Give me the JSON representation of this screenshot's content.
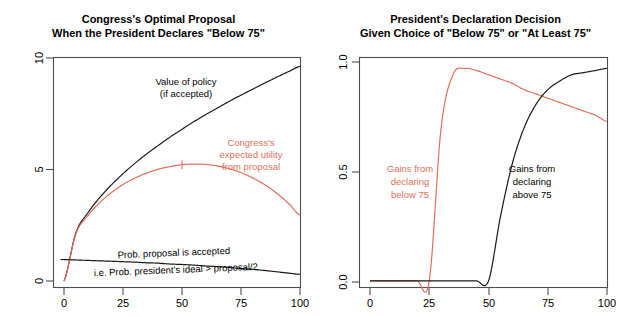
{
  "figure": {
    "background": "#ffffff",
    "series_colors": {
      "black": "#1a1a1a",
      "red": "#e2705a"
    }
  },
  "panels": [
    {
      "id": "left",
      "title_line1": "Congress's Optimal Proposal",
      "title_line2": "When the President Declares \"Below 75\"",
      "annotations": [
        {
          "name": "value-of-policy-label",
          "line1": "Value of policy",
          "line2": "(if accepted)",
          "color": "#1a1a1a"
        },
        {
          "name": "congress-expected-utility-label",
          "line1": "Congress's",
          "line2": "expected utility",
          "line3": "from proposal",
          "color": "#e2705a"
        },
        {
          "name": "prob-accepted-label",
          "line1": "Prob. proposal is accepted",
          "line2": "i.e. Prob. president's ideal > proposal/2",
          "color": "#1a1a1a"
        }
      ],
      "xticks": [
        "0",
        "25",
        "50",
        "75",
        "100"
      ],
      "yticks": [
        "0",
        "5",
        "10"
      ]
    },
    {
      "id": "right",
      "title_line1": "President's Declaration Decision",
      "title_line2": "Given Choice of \"Below 75\" or \"At Least 75\"",
      "annotations": [
        {
          "name": "gains-below-75-label",
          "line1": "Gains from",
          "line2": "declaring",
          "line3": "below 75",
          "color": "#e2705a"
        },
        {
          "name": "gains-above-75-label",
          "line1": "Gains from",
          "line2": "declaring",
          "line3": "above 75",
          "color": "#1a1a1a"
        }
      ],
      "xticks": [
        "0",
        "25",
        "50",
        "75",
        "100"
      ],
      "yticks": [
        "0.0",
        "0.5",
        "1.0"
      ]
    }
  ],
  "chart_data": [
    {
      "type": "line",
      "title": "Congress's Optimal Proposal When the President Declares \"Below 75\"",
      "xlabel": "",
      "ylabel": "",
      "xlim": [
        0,
        100
      ],
      "ylim": [
        0,
        10.4
      ],
      "grid": false,
      "legend": "inline-annotations",
      "x": [
        0,
        5,
        10,
        15,
        20,
        25,
        30,
        35,
        40,
        45,
        50,
        55,
        60,
        65,
        70,
        75,
        80,
        85,
        90,
        95,
        100
      ],
      "series": [
        {
          "name": "Value of policy (if accepted)",
          "color": "#1a1a1a",
          "values": [
            0.0,
            2.24,
            3.16,
            3.87,
            4.47,
            5.0,
            5.48,
            5.92,
            6.32,
            6.71,
            7.07,
            7.42,
            7.75,
            8.06,
            8.37,
            8.66,
            8.94,
            9.22,
            9.49,
            9.75,
            10.0
          ]
        },
        {
          "name": "Congress's expected utility from proposal",
          "color": "#e2705a",
          "values": [
            0.0,
            2.19,
            3.03,
            3.64,
            4.11,
            4.5,
            4.79,
            5.03,
            5.21,
            5.33,
            5.42,
            5.45,
            5.43,
            5.36,
            5.23,
            5.05,
            4.8,
            4.49,
            4.1,
            3.63,
            3.07
          ]
        },
        {
          "name": "Prob. proposal is accepted (i.e. Prob. president's ideal > proposal/2)",
          "color": "#1a1a1a",
          "values": [
            1.0,
            0.98,
            0.96,
            0.94,
            0.92,
            0.9,
            0.88,
            0.85,
            0.83,
            0.79,
            0.77,
            0.74,
            0.7,
            0.67,
            0.63,
            0.58,
            0.54,
            0.49,
            0.43,
            0.37,
            0.31
          ]
        }
      ],
      "xticks": [
        0,
        25,
        50,
        75,
        100
      ],
      "yticks": [
        0,
        5,
        10
      ],
      "markers": [
        {
          "series": "Congress's expected utility from proposal",
          "x": 50,
          "y": 5.42,
          "note": "optimal proposal"
        },
        {
          "series": "Prob. proposal is accepted",
          "x": 0,
          "y": 1.0,
          "note": "intercept"
        }
      ]
    },
    {
      "type": "line",
      "title": "President's Declaration Decision Given Choice of \"Below 75\" or \"At Least 75\"",
      "xlabel": "",
      "ylabel": "",
      "xlim": [
        0,
        100
      ],
      "ylim": [
        -0.03,
        1.05
      ],
      "grid": false,
      "legend": "inline-annotations",
      "x": [
        0,
        5,
        10,
        15,
        20,
        25,
        30,
        35,
        40,
        45,
        50,
        55,
        60,
        65,
        70,
        75,
        80,
        85,
        90,
        95,
        100
      ],
      "series": [
        {
          "name": "Gains from declaring below 75",
          "color": "#e2705a",
          "values": [
            0.0,
            0.0,
            0.0,
            0.0,
            0.0,
            0.0,
            0.72,
            0.97,
            1.0,
            0.99,
            0.97,
            0.95,
            0.93,
            0.9,
            0.88,
            0.86,
            0.84,
            0.82,
            0.8,
            0.78,
            0.75
          ]
        },
        {
          "name": "Gains from declaring above 75",
          "color": "#1a1a1a",
          "values": [
            0.0,
            0.0,
            0.0,
            0.0,
            0.0,
            0.0,
            0.0,
            0.0,
            0.0,
            0.0,
            0.0,
            0.3,
            0.55,
            0.72,
            0.83,
            0.9,
            0.94,
            0.97,
            0.98,
            0.99,
            1.0
          ]
        }
      ],
      "xticks": [
        0,
        25,
        50,
        75,
        100
      ],
      "yticks": [
        0.0,
        0.5,
        1.0
      ],
      "annotations": [
        {
          "text": "curves cross near x = 78",
          "x": 78,
          "y": 0.83
        }
      ]
    }
  ]
}
